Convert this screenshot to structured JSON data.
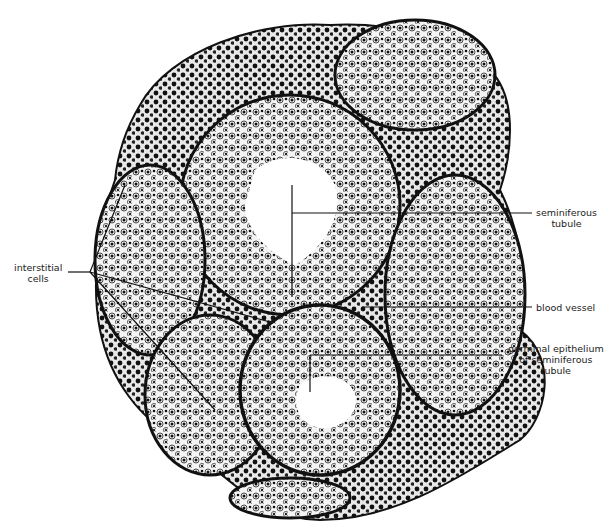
{
  "figure": {
    "labels": [
      {
        "id": "interstitial-cells",
        "lines": [
          "interstitial",
          "cells"
        ]
      },
      {
        "id": "seminiferous-tubule",
        "lines": [
          "seminiferous",
          "tubule"
        ]
      },
      {
        "id": "blood-vessel",
        "lines": [
          "blood vessel"
        ]
      },
      {
        "id": "germinal-epithelium",
        "lines": [
          "germinal epithelium",
          "of seminiferous",
          "tubule"
        ]
      }
    ],
    "colors": {
      "ink": "#111111",
      "background": "#ffffff",
      "label": "#222222"
    }
  }
}
